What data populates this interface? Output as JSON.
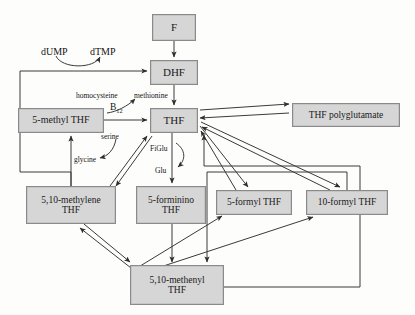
{
  "diagram": {
    "colors": {
      "node_fill": "#d6d6d6",
      "node_border": "#8a8a8a",
      "edge": "#3a3a3a",
      "background": "#fdfdfc",
      "text": "#1a1a1a"
    },
    "nodes": [
      {
        "id": "f",
        "label": "F",
        "lines": [
          "F"
        ],
        "x": 152,
        "y": 14,
        "w": 44,
        "h": 27,
        "font": 11
      },
      {
        "id": "dhf",
        "label": "DHF",
        "lines": [
          "DHF"
        ],
        "x": 150,
        "y": 60,
        "w": 48,
        "h": 25,
        "font": 11
      },
      {
        "id": "thf",
        "label": "THF",
        "lines": [
          "THF"
        ],
        "x": 150,
        "y": 108,
        "w": 48,
        "h": 25,
        "font": 11
      },
      {
        "id": "thf_poly",
        "label": "THF polyglutamate",
        "lines": [
          "THF polyglutamate"
        ],
        "x": 292,
        "y": 103,
        "w": 108,
        "h": 24,
        "font": 9.5
      },
      {
        "id": "methyl",
        "label": "5-methyl THF",
        "lines": [
          "5-methyl THF"
        ],
        "x": 18,
        "y": 108,
        "w": 86,
        "h": 25,
        "font": 10
      },
      {
        "id": "methylene",
        "label": "5,10-methylene THF",
        "lines": [
          "5,10-methylene",
          "THF"
        ],
        "x": 26,
        "y": 186,
        "w": 90,
        "h": 38,
        "font": 9.5
      },
      {
        "id": "forminino",
        "label": "5-forminino THF",
        "lines": [
          "5-forminino",
          "THF"
        ],
        "x": 136,
        "y": 186,
        "w": 70,
        "h": 38,
        "font": 9.5
      },
      {
        "id": "formyl5",
        "label": "5-formyl THF",
        "lines": [
          "5-formyl THF"
        ],
        "x": 216,
        "y": 190,
        "w": 76,
        "h": 25,
        "font": 9.5
      },
      {
        "id": "formyl10",
        "label": "10-formyl THF",
        "lines": [
          "10-formyl THF"
        ],
        "x": 306,
        "y": 190,
        "w": 82,
        "h": 25,
        "font": 9.5
      },
      {
        "id": "methenyl",
        "label": "5,10-methenyl THF",
        "lines": [
          "5,10-methenyl",
          "THF"
        ],
        "x": 130,
        "y": 265,
        "w": 94,
        "h": 40,
        "font": 9.5
      }
    ],
    "edge_labels": [
      {
        "id": "dump",
        "text": "dUMP",
        "x": 41,
        "y": 46,
        "font": 10
      },
      {
        "id": "dtmp",
        "text": "dTMP",
        "x": 90,
        "y": 46,
        "font": 10
      },
      {
        "id": "homocysteine",
        "text": "homocysteine",
        "x": 76,
        "y": 91,
        "font": 7.5
      },
      {
        "id": "methionine",
        "text": "methionine",
        "x": 134,
        "y": 91,
        "font": 7.5
      },
      {
        "id": "b12",
        "text": "B12",
        "x": 110,
        "y": 104,
        "font": 9.5
      },
      {
        "id": "serine",
        "text": "serine",
        "x": 101,
        "y": 132,
        "font": 7.5
      },
      {
        "id": "glycine",
        "text": "glycine",
        "x": 74,
        "y": 155,
        "font": 7.5
      },
      {
        "id": "figlu",
        "text": "FiGlu",
        "x": 150,
        "y": 146,
        "font": 7.5
      },
      {
        "id": "glu",
        "text": "Glu",
        "x": 155,
        "y": 168,
        "font": 7.5
      }
    ],
    "relations": [
      {
        "from": "f",
        "to": "dhf",
        "type": "arrow"
      },
      {
        "from": "dhf",
        "to": "thf",
        "type": "arrow"
      },
      {
        "from": "methylene",
        "to": "dhf",
        "type": "arrow",
        "via": "dUMP to dTMP conversion"
      },
      {
        "from": "methyl",
        "to": "thf",
        "type": "arrow",
        "via": "homocysteine to methionine, B12"
      },
      {
        "from": "thf",
        "to": "thf_poly",
        "type": "double-arrow"
      },
      {
        "from": "thf",
        "to": "methylene",
        "type": "double-arrow",
        "via": "serine / glycine"
      },
      {
        "from": "methylene",
        "to": "methyl",
        "type": "arrow"
      },
      {
        "from": "thf",
        "to": "forminino",
        "type": "arrow",
        "via": "FiGlu to Glu"
      },
      {
        "from": "formyl5",
        "to": "thf",
        "type": "arrow"
      },
      {
        "from": "formyl10",
        "to": "thf",
        "type": "arrow"
      },
      {
        "from": "thf",
        "to": "formyl5",
        "type": "arrow"
      },
      {
        "from": "thf",
        "to": "formyl10",
        "type": "arrow"
      },
      {
        "from": "forminino",
        "to": "methenyl",
        "type": "arrow"
      },
      {
        "from": "methylene",
        "to": "methenyl",
        "type": "double-arrow"
      },
      {
        "from": "methenyl",
        "to": "formyl5",
        "type": "arrow"
      },
      {
        "from": "methenyl",
        "to": "formyl10",
        "type": "arrow"
      },
      {
        "from": "formyl10",
        "to": "methenyl",
        "type": "arrow"
      },
      {
        "from": "methenyl",
        "to": "thf",
        "type": "arrow"
      }
    ]
  }
}
